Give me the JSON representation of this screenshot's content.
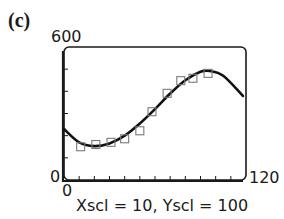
{
  "panel": {
    "label": "(c)"
  },
  "axes": {
    "y_max_label": "600",
    "y_min_label": "0",
    "x_min_label": "0",
    "x_max_label": "120",
    "caption": "Xscl = 10, Yscl = 100"
  },
  "chart_data": {
    "type": "scatter",
    "title": "(c)",
    "xlabel": "",
    "ylabel": "",
    "xlim": [
      0,
      120
    ],
    "ylim": [
      0,
      600
    ],
    "x_scale": 10,
    "y_scale": 100,
    "grid": false,
    "legend": null,
    "annotations": [
      "Xscl = 10, Yscl = 100"
    ],
    "series": [
      {
        "name": "data points",
        "marker": "square-open",
        "x": [
          11,
          21,
          31,
          40,
          50,
          58,
          68,
          77,
          85,
          95
        ],
        "y": [
          150,
          160,
          170,
          186,
          222,
          308,
          391,
          448,
          459,
          481
        ]
      },
      {
        "name": "cubic model curve",
        "style": "line",
        "x": [
          0,
          10,
          20,
          30,
          40,
          50,
          60,
          70,
          80,
          90,
          96,
          105,
          118
        ],
        "y": [
          230,
          170,
          153,
          165,
          200,
          255,
          320,
          390,
          450,
          488,
          492,
          470,
          379
        ]
      }
    ]
  },
  "colors": {
    "axis": "#1a1a1a",
    "curve": "#111111",
    "marker": "#7a7a7a",
    "background": "#ffffff"
  }
}
